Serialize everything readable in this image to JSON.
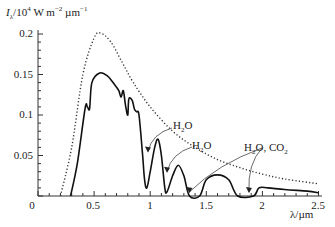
{
  "chart_data": {
    "type": "line",
    "title": "",
    "xlabel": "λ/µm",
    "ylabel_parts": {
      "symbol": "I",
      "subscript": "λ",
      "rest": "/10",
      "exp": "4",
      "unit1": " W m",
      "exp2": "−2",
      "unit2": " µm",
      "exp3": "−1"
    },
    "ylabel": "Iλ/10^4 W m^-2 µm^-1",
    "xlim": [
      0,
      2.5
    ],
    "ylim": [
      0,
      0.2
    ],
    "x_ticks": [
      "0",
      "0.5",
      "1",
      "1.5",
      "2",
      "2.5"
    ],
    "y_ticks": [
      "0.05",
      "0.1",
      "0.15",
      "0.2"
    ],
    "grid": false,
    "legend": "none",
    "series": [
      {
        "name": "Outside atmosphere (dotted)",
        "style": "dotted",
        "points": [
          [
            0.2,
            0.0
          ],
          [
            0.3,
            0.06
          ],
          [
            0.4,
            0.15
          ],
          [
            0.5,
            0.195
          ],
          [
            0.56,
            0.201
          ],
          [
            0.65,
            0.19
          ],
          [
            0.75,
            0.165
          ],
          [
            0.85,
            0.14
          ],
          [
            1.0,
            0.11
          ],
          [
            1.2,
            0.08
          ],
          [
            1.4,
            0.06
          ],
          [
            1.6,
            0.045
          ],
          [
            1.8,
            0.035
          ],
          [
            2.0,
            0.027
          ],
          [
            2.2,
            0.021
          ],
          [
            2.5,
            0.015
          ]
        ]
      },
      {
        "name": "At sea level (solid)",
        "style": "solid",
        "points": [
          [
            0.29,
            0.0
          ],
          [
            0.35,
            0.04
          ],
          [
            0.42,
            0.108
          ],
          [
            0.44,
            0.11
          ],
          [
            0.46,
            0.108
          ],
          [
            0.48,
            0.14
          ],
          [
            0.55,
            0.152
          ],
          [
            0.62,
            0.148
          ],
          [
            0.68,
            0.138
          ],
          [
            0.72,
            0.13
          ],
          [
            0.74,
            0.122
          ],
          [
            0.76,
            0.13
          ],
          [
            0.78,
            0.112
          ],
          [
            0.8,
            0.1
          ],
          [
            0.81,
            0.12
          ],
          [
            0.84,
            0.118
          ],
          [
            0.86,
            0.107
          ],
          [
            0.88,
            0.104
          ],
          [
            0.9,
            0.1
          ],
          [
            0.93,
            0.055
          ],
          [
            0.95,
            0.02
          ],
          [
            0.97,
            0.01
          ],
          [
            1.0,
            0.03
          ],
          [
            1.04,
            0.06
          ],
          [
            1.07,
            0.07
          ],
          [
            1.1,
            0.05
          ],
          [
            1.13,
            0.01
          ],
          [
            1.15,
            0.005
          ],
          [
            1.2,
            0.025
          ],
          [
            1.25,
            0.038
          ],
          [
            1.3,
            0.025
          ],
          [
            1.35,
            0.0
          ],
          [
            1.44,
            0.0
          ],
          [
            1.5,
            0.02
          ],
          [
            1.6,
            0.026
          ],
          [
            1.7,
            0.02
          ],
          [
            1.78,
            0.0
          ],
          [
            1.92,
            0.0
          ],
          [
            1.97,
            0.01
          ],
          [
            2.05,
            0.01
          ],
          [
            2.2,
            0.008
          ],
          [
            2.4,
            0.006
          ],
          [
            2.5,
            0.004
          ]
        ]
      }
    ],
    "annotations": [
      {
        "text": "H₂O",
        "arrow_to": [
          0.98,
          0.055
        ]
      },
      {
        "text": "H₂O",
        "arrow_to": [
          1.15,
          0.03
        ]
      },
      {
        "text": "H₂O, CO₂",
        "arrow_to": [
          1.35,
          0.005
        ]
      },
      {
        "text": "H₂O, CO₂",
        "arrow_to": [
          1.88,
          0.005
        ]
      }
    ]
  },
  "labels": {
    "y_sym": "I",
    "y_sub": "λ",
    "y_rest": "/10",
    "y_exp": "4",
    "y_unit1": " W m",
    "y_exp2": "−2",
    "y_unit2": " µm",
    "y_exp3": "−1",
    "xlabel": "λ/µm",
    "ann1_main": "H",
    "ann1_sub": "2",
    "ann1_end": "O",
    "ann2_main": "H",
    "ann2_sub": "2",
    "ann2_end": "O",
    "ann3_a": "H",
    "ann3_sub1": "2",
    "ann3_b": "O, CO",
    "ann3_sub2": "2",
    "tick_y0": "0.2",
    "tick_y1": "0.15",
    "tick_y2": "0.1",
    "tick_y3": "0.05",
    "tick_x0": "0",
    "tick_x1": "0.5",
    "tick_x2": "1",
    "tick_x3": "1.5",
    "tick_x4": "2",
    "tick_x5": "2.5"
  }
}
